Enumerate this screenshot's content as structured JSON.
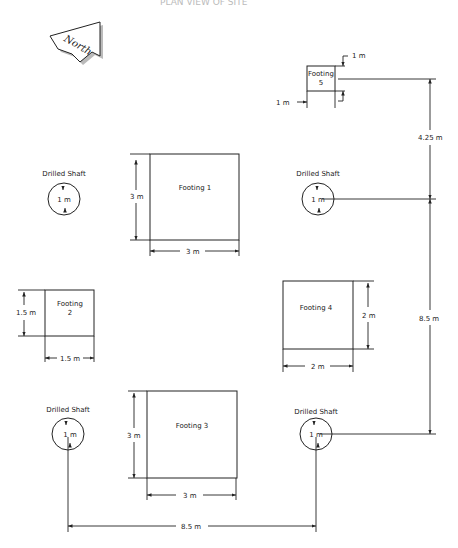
{
  "diagram": {
    "title_partial": "PLAN VIEW OF SITE",
    "north_arrow": {
      "label": "North"
    },
    "footings": [
      {
        "id": 1,
        "label": "Footing 1",
        "width_label": "3 m",
        "height_label": "3 m"
      },
      {
        "id": 2,
        "label_line1": "Footing",
        "label_line2": "2",
        "width_label": "1.5 m",
        "height_label": "1.5 m"
      },
      {
        "id": 3,
        "label": "Footing 3",
        "width_label": "3 m",
        "height_label": "3 m"
      },
      {
        "id": 4,
        "label": "Footing 4",
        "width_label": "2 m",
        "height_label": "2 m"
      },
      {
        "id": 5,
        "label_line1": "Footing",
        "label_line2": "5",
        "width_label": "1 m",
        "height_label": "1 m"
      }
    ],
    "drilled_shafts": [
      {
        "position": "top-left",
        "label": "Drilled Shaft",
        "diameter_label": "1 m"
      },
      {
        "position": "top-right",
        "label": "Drilled Shaft",
        "diameter_label": "1 m"
      },
      {
        "position": "bottom-left",
        "label": "Drilled Shaft",
        "diameter_label": "1 m"
      },
      {
        "position": "bottom-right",
        "label": "Drilled Shaft",
        "diameter_label": "1 m"
      }
    ],
    "dimensions": {
      "footing5_to_shaft_vertical": "4.25 m",
      "shaft_top_to_bottom_vertical": "8.5 m",
      "shaft_left_to_right_horizontal": "8.5 m"
    }
  }
}
